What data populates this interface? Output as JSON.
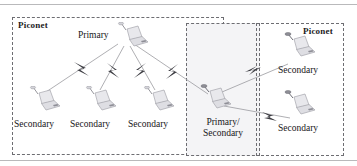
{
  "diagram": {
    "title_text_elements": [
      "Piconet",
      "Piconet"
    ],
    "groups": [
      {
        "id": "piconet-left",
        "label": "Piconet",
        "label_position": "top-left"
      },
      {
        "id": "piconet-right",
        "label": "Piconet",
        "label_position": "top-right"
      }
    ],
    "overlap_region": {
      "id": "scatternet-overlap",
      "fill": "#f4f4f6"
    },
    "nodes": [
      {
        "id": "primary",
        "label": "Primary",
        "role": "primary",
        "icon": "laptop-icon",
        "x": 117,
        "y": 22,
        "label_x": 78,
        "label_y": 30
      },
      {
        "id": "secondary-1",
        "label": "Secondary",
        "role": "secondary",
        "icon": "laptop-icon",
        "x": 29,
        "y": 86,
        "label_x": 16,
        "label_y": 120
      },
      {
        "id": "secondary-2",
        "label": "Secondary",
        "role": "secondary",
        "icon": "laptop-icon",
        "x": 85,
        "y": 86,
        "label_x": 72,
        "label_y": 120
      },
      {
        "id": "secondary-3",
        "label": "Secondary",
        "role": "secondary",
        "icon": "laptop-icon",
        "x": 143,
        "y": 86,
        "label_x": 130,
        "label_y": 120
      },
      {
        "id": "primary-secondary",
        "label": "Primary/\nSecondary",
        "role": "primary-secondary",
        "icon": "laptop-icon",
        "x": 203,
        "y": 86,
        "label_x": 193,
        "label_y": 118
      },
      {
        "id": "secondary-4",
        "label": "Secondary",
        "role": "secondary",
        "icon": "laptop-icon",
        "x": 286,
        "y": 33,
        "label_x": 280,
        "label_y": 66
      },
      {
        "id": "secondary-5",
        "label": "Secondary",
        "role": "secondary",
        "icon": "laptop-icon",
        "x": 286,
        "y": 91,
        "label_x": 280,
        "label_y": 124
      }
    ],
    "links": [
      {
        "from": "primary",
        "to": "secondary-1",
        "style": "wireless-bolt"
      },
      {
        "from": "primary",
        "to": "secondary-2",
        "style": "wireless-bolt"
      },
      {
        "from": "primary",
        "to": "secondary-3",
        "style": "wireless-bolt"
      },
      {
        "from": "primary",
        "to": "primary-secondary",
        "style": "wireless-bolt"
      },
      {
        "from": "primary-secondary",
        "to": "secondary-4",
        "style": "wireless-bolt"
      },
      {
        "from": "primary-secondary",
        "to": "secondary-5",
        "style": "wireless-bolt"
      }
    ],
    "colors": {
      "dashed_border": "#6d6d72",
      "link_line": "#8d8d93",
      "bolt": "#3a3a3f",
      "text": "#17171a",
      "overlap_fill": "#f4f4f6",
      "frame_line": "#b9b9bb",
      "laptop_body": "#e3e3e6",
      "laptop_shade": "#c9c9cf"
    },
    "labels": {
      "primary": "Primary",
      "secondary": "Secondary",
      "primary_secondary_line1": "Primary/",
      "primary_secondary_line2": "Secondary",
      "piconet": "Piconet"
    }
  }
}
